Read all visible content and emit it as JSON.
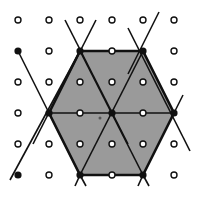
{
  "figure": {
    "width": 197,
    "height": 198,
    "colors": {
      "background": "#ffffff",
      "fill": "#9a9a9a",
      "line": "#111111",
      "open_dot_fill": "#ffffff",
      "filled_dot": "#111111"
    },
    "grid": {
      "xs": [
        18,
        49,
        80,
        112,
        143,
        174
      ],
      "ys": [
        20,
        51,
        82,
        113,
        144,
        175
      ]
    },
    "hexagon": [
      [
        80,
        51
      ],
      [
        143,
        51
      ],
      [
        174,
        113
      ],
      [
        143,
        175
      ],
      [
        80,
        175
      ],
      [
        49,
        113
      ]
    ],
    "inner_lines": [
      [
        [
          80,
          51
        ],
        [
          143,
          175
        ]
      ],
      [
        [
          143,
          51
        ],
        [
          80,
          175
        ]
      ],
      [
        [
          49,
          113
        ],
        [
          174,
          113
        ]
      ]
    ],
    "extended_lines": [
      [
        [
          65,
          20
        ],
        [
          128,
          144
        ]
      ],
      [
        [
          96,
          20
        ],
        [
          33,
          144
        ]
      ],
      [
        [
          128,
          28
        ],
        [
          190,
          151
        ]
      ],
      [
        [
          159,
          12
        ],
        [
          128,
          74
        ]
      ],
      [
        [
          18,
          51
        ],
        [
          80,
          175
        ]
      ],
      [
        [
          10,
          180
        ],
        [
          80,
          51
        ]
      ],
      [
        [
          75,
          186
        ],
        [
          80,
          175
        ]
      ],
      [
        [
          86,
          186
        ],
        [
          80,
          175
        ]
      ],
      [
        [
          138,
          186
        ],
        [
          143,
          175
        ]
      ],
      [
        [
          149,
          186
        ],
        [
          143,
          175
        ]
      ],
      [
        [
          174,
          113
        ],
        [
          183,
          95
        ]
      ]
    ],
    "filled_dots": [
      [
        18,
        51
      ],
      [
        80,
        51
      ],
      [
        143,
        51
      ],
      [
        49,
        113
      ],
      [
        112,
        113
      ],
      [
        174,
        113
      ],
      [
        18,
        175
      ],
      [
        80,
        175
      ],
      [
        143,
        175
      ]
    ],
    "small_mark": [
      100,
      118
    ]
  }
}
